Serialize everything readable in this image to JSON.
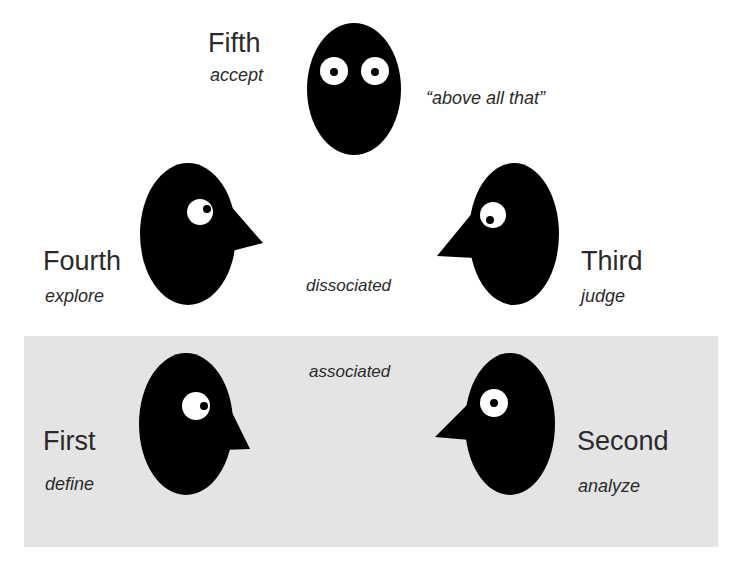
{
  "colors": {
    "background": "#ffffff",
    "associated_panel": "#e4e4e4",
    "head": "#000000",
    "eye": "#ffffff",
    "text": "#2a2a2a"
  },
  "positions": [
    {
      "id": "fifth",
      "title": "Fifth",
      "subtitle": "accept",
      "note": "“above all that”",
      "facing": "front"
    },
    {
      "id": "fourth",
      "title": "Fourth",
      "subtitle": "explore",
      "facing": "right"
    },
    {
      "id": "third",
      "title": "Third",
      "subtitle": "judge",
      "facing": "left"
    },
    {
      "id": "first",
      "title": "First",
      "subtitle": "define",
      "facing": "right"
    },
    {
      "id": "second",
      "title": "Second",
      "subtitle": "analyze",
      "facing": "left"
    }
  ],
  "zones": {
    "dissociated": "dissociated",
    "associated": "associated"
  }
}
